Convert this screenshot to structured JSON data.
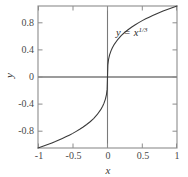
{
  "chart_data": {
    "type": "line",
    "title": "",
    "subtitle": "",
    "xlabel": "x",
    "ylabel": "y",
    "annotation": "y = x^1/3",
    "annotation_parts": {
      "lhs": "y",
      "operator": "=",
      "base": "x",
      "exponent": "1/3"
    },
    "xlim": [
      -1,
      1
    ],
    "ylim": [
      -1,
      1
    ],
    "xticks": [
      -1,
      -0.5,
      0,
      0.5,
      1
    ],
    "xtick_labels": [
      "-1",
      "-0.5",
      "0",
      "0.5",
      "1"
    ],
    "yticks": [
      -0.8,
      -0.4,
      0,
      0.4,
      0.8
    ],
    "ytick_labels": [
      "-0.8",
      "-0.4",
      "0",
      "0.4",
      "-0.8"
    ],
    "ytick_labels_display": [
      "0.8",
      "0.4",
      "0",
      "-0.4",
      "-0.8"
    ],
    "grid": false,
    "legend": "none",
    "zero_axes": true,
    "series": [
      {
        "name": "y = x^1/3",
        "x": [
          -1.0,
          -0.95,
          -0.9,
          -0.85,
          -0.8,
          -0.75,
          -0.7,
          -0.65,
          -0.6,
          -0.55,
          -0.5,
          -0.45,
          -0.4,
          -0.35,
          -0.3,
          -0.25,
          -0.2,
          -0.15,
          -0.1,
          -0.07,
          -0.05,
          -0.03,
          -0.015,
          -0.005,
          0.0,
          0.005,
          0.015,
          0.03,
          0.05,
          0.07,
          0.1,
          0.15,
          0.2,
          0.25,
          0.3,
          0.35,
          0.4,
          0.45,
          0.5,
          0.55,
          0.6,
          0.65,
          0.7,
          0.75,
          0.8,
          0.85,
          0.9,
          0.95,
          1.0
        ],
        "y": [
          -1.0,
          -0.983,
          -0.965,
          -0.947,
          -0.928,
          -0.909,
          -0.888,
          -0.866,
          -0.843,
          -0.819,
          -0.794,
          -0.766,
          -0.737,
          -0.705,
          -0.669,
          -0.63,
          -0.585,
          -0.531,
          -0.464,
          -0.412,
          -0.368,
          -0.311,
          -0.247,
          -0.171,
          0.0,
          0.171,
          0.247,
          0.311,
          0.368,
          0.412,
          0.464,
          0.531,
          0.585,
          0.63,
          0.669,
          0.705,
          0.737,
          0.766,
          0.794,
          0.819,
          0.843,
          0.866,
          0.888,
          0.909,
          0.928,
          0.947,
          0.965,
          0.983,
          1.0
        ],
        "color": "#3a3a3a",
        "linewidth": 1.1
      }
    ],
    "colors": {
      "curve": "#3a3a3a",
      "frame": "#8c8c8c",
      "zero_axis": "#707070",
      "text": "#3a3a3a",
      "background": "#ffffff"
    },
    "plot_area": {
      "left": 38,
      "right": 177,
      "top": 6,
      "bottom": 148
    }
  }
}
